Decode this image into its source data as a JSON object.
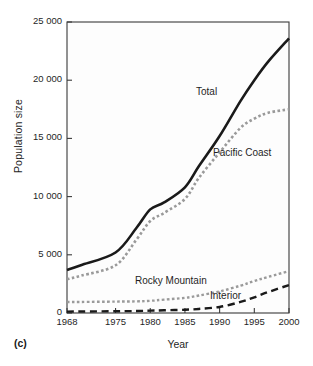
{
  "panel": {
    "label": "(c)"
  },
  "chart_data": {
    "type": "line",
    "title": "",
    "xlabel": "Year",
    "ylabel": "Population size",
    "xlim": [
      1968,
      2000
    ],
    "ylim": [
      0,
      25000
    ],
    "grid": false,
    "legend_position": "inline-annotations",
    "xticks": [
      "1968",
      "1975",
      "1980",
      "1985",
      "1990",
      "1995",
      "2000"
    ],
    "xtick_values": [
      1968,
      1975,
      1980,
      1985,
      1990,
      1995,
      2000
    ],
    "yticks": [
      "0",
      "5 000",
      "10 000",
      "15 000",
      "20 000",
      "25 000"
    ],
    "ytick_values": [
      0,
      5000,
      10000,
      15000,
      20000,
      25000
    ],
    "x": [
      1968,
      1970,
      1975,
      1978,
      1980,
      1982,
      1985,
      1987,
      1990,
      1993,
      1995,
      1997,
      2000
    ],
    "series": [
      {
        "name": "Total",
        "label": "Total",
        "color": "#1a1a1a",
        "style": "solid",
        "width": 2.6,
        "values": [
          3700,
          4100,
          5200,
          7300,
          8900,
          9500,
          10800,
          12600,
          15200,
          18200,
          20000,
          21600,
          23600
        ]
      },
      {
        "name": "Pacific Coast",
        "label": "Pacific Coast",
        "color": "#9a9a9a",
        "style": "dotted",
        "width": 2.6,
        "values": [
          2900,
          3200,
          4100,
          6300,
          7900,
          8600,
          9800,
          11600,
          13800,
          15900,
          16700,
          17200,
          17500
        ]
      },
      {
        "name": "Rocky Mountain",
        "label": "Rocky Mountain",
        "color": "#9a9a9a",
        "style": "dotted",
        "width": 2.4,
        "values": [
          950,
          950,
          980,
          1000,
          1050,
          1150,
          1300,
          1500,
          1850,
          2350,
          2750,
          3100,
          3600
        ]
      },
      {
        "name": "Interior",
        "label": "Interior",
        "color": "#1a1a1a",
        "style": "dashed",
        "width": 2.4,
        "values": [
          120,
          130,
          150,
          170,
          200,
          230,
          280,
          350,
          520,
          950,
          1350,
          1800,
          2400
        ]
      }
    ]
  }
}
